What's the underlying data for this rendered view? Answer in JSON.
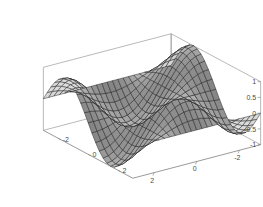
{
  "figure": {
    "kind": "mathematica-3d-surface-plot",
    "background_color": "#ffffff",
    "width": 263,
    "height": 207,
    "mesh_color": "#202020",
    "box_color": "#8a8a8a",
    "label_color": "#4a4a4a",
    "shading": "grayscale-diffuse"
  },
  "chart_data": {
    "type": "surface",
    "title": "",
    "xlabel": "",
    "ylabel": "",
    "zlabel": "",
    "function": "sin(x)*cos(y)",
    "xlim": [
      -3.141592653589793,
      3.141592653589793
    ],
    "ylim": [
      -3.141592653589793,
      3.141592653589793
    ],
    "zlim": [
      -1,
      1
    ],
    "mesh_divisions_x": 24,
    "mesh_divisions_y": 24,
    "grid": false,
    "legend": null,
    "colormap": "grayscale",
    "x_ticks": [
      -2,
      0,
      2
    ],
    "x_tick_labels": [
      "-2",
      "0",
      "2"
    ],
    "y_ticks": [
      -2,
      0,
      2
    ],
    "y_tick_labels": [
      "-2",
      "0",
      "2"
    ],
    "z_ticks": [
      -1,
      -0.5,
      0,
      0.5,
      1
    ],
    "z_tick_labels": [
      "-1",
      "-0.5",
      "0",
      "0.5",
      "1"
    ],
    "view": {
      "azimuth_deg": 55,
      "elevation_deg": 22,
      "projection": "orthographic"
    },
    "annotations": []
  },
  "axes": {
    "z_axis_name": "z-axis",
    "x_axis_name": "x-axis",
    "y_axis_name": "y-axis"
  }
}
